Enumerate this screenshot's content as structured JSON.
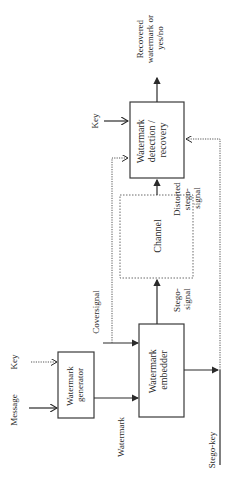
{
  "diagram": {
    "orientation": "rotated-90-ccw",
    "blocks": {
      "generator": {
        "line1": "Watermark",
        "line2": "generator"
      },
      "embedder": {
        "line1": "Watermark",
        "line2": "embedder"
      },
      "channel": {
        "line1": "Channel"
      },
      "detection": {
        "line1": "Watermark",
        "line2": "detection /",
        "line3": "recovery"
      }
    },
    "labels": {
      "message": "Message",
      "key_generator": "Key",
      "watermark": "Watermark",
      "coversignal": "Coversignal",
      "stego_signal_1": "Stego-",
      "stego_signal_2": "signal",
      "distorted_1": "Distorted",
      "distorted_2": "stego-",
      "distorted_3": "signal",
      "key_detection": "Key",
      "output_1": "Recovered",
      "output_2": "watermark or",
      "output_3": "yes/no",
      "stego_key": "Stego-key"
    },
    "colors": {
      "stroke": "#2a2a2a",
      "dotted": "#555555",
      "background": "#ffffff"
    }
  }
}
